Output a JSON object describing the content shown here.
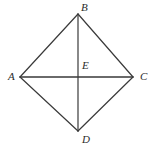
{
  "figure": {
    "type": "geometry-diagram",
    "shape_name": "rhombus",
    "background_color": "#ffffff",
    "stroke_color": "#3a3a3a",
    "stroke_width": 1.2,
    "label_color": "#2b2b2b",
    "canvas": {
      "width": 155,
      "height": 148
    },
    "points": [
      {
        "id": "A",
        "label": "A",
        "x": 20,
        "y": 77,
        "label_x": 8,
        "label_y": 71
      },
      {
        "id": "B",
        "label": "B",
        "x": 78,
        "y": 14,
        "label_x": 81,
        "label_y": 2
      },
      {
        "id": "C",
        "label": "C",
        "x": 133,
        "y": 77,
        "label_x": 140,
        "label_y": 71
      },
      {
        "id": "D",
        "label": "D",
        "x": 78,
        "y": 131,
        "label_x": 82,
        "label_y": 134
      },
      {
        "id": "E",
        "label": "E",
        "x": 78,
        "y": 77,
        "label_x": 82,
        "label_y": 60
      }
    ],
    "segments": [
      {
        "id": "AB",
        "from": "A",
        "to": "B",
        "x1": 20,
        "y1": 77,
        "x2": 78,
        "y2": 14
      },
      {
        "id": "BC",
        "from": "B",
        "to": "C",
        "x1": 78,
        "y1": 14,
        "x2": 133,
        "y2": 77
      },
      {
        "id": "CD",
        "from": "C",
        "to": "D",
        "x1": 133,
        "y1": 77,
        "x2": 78,
        "y2": 131
      },
      {
        "id": "DA",
        "from": "D",
        "to": "A",
        "x1": 78,
        "y1": 131,
        "x2": 20,
        "y2": 77
      },
      {
        "id": "AC",
        "from": "A",
        "to": "C",
        "x1": 20,
        "y1": 77,
        "x2": 133,
        "y2": 77
      },
      {
        "id": "BD",
        "from": "B",
        "to": "D",
        "x1": 78,
        "y1": 14,
        "x2": 78,
        "y2": 131
      }
    ]
  }
}
